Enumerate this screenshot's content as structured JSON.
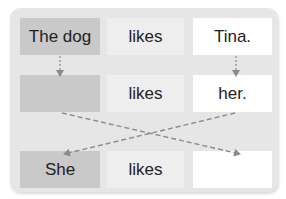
{
  "colors": {
    "panel": "#e6e6e6",
    "subject_box": "#c9c9c9",
    "verb_box": "#eeeeee",
    "object_box": "#ffffff",
    "arrow": "#8a8a8a",
    "text": "#222222"
  },
  "rows": [
    {
      "subject": "The dog",
      "verb": "likes",
      "object": "Tina."
    },
    {
      "subject": "",
      "verb": "likes",
      "object": "her."
    },
    {
      "subject": "She",
      "verb": "likes",
      "object": ""
    }
  ],
  "arrows": [
    {
      "from": "row0.subject",
      "to": "row1.subject",
      "style": "dashed"
    },
    {
      "from": "row0.object",
      "to": "row1.object",
      "style": "dashed"
    },
    {
      "from": "row1.subject",
      "to": "row2.object",
      "style": "dashed"
    },
    {
      "from": "row1.object",
      "to": "row2.subject",
      "style": "dashed"
    }
  ]
}
